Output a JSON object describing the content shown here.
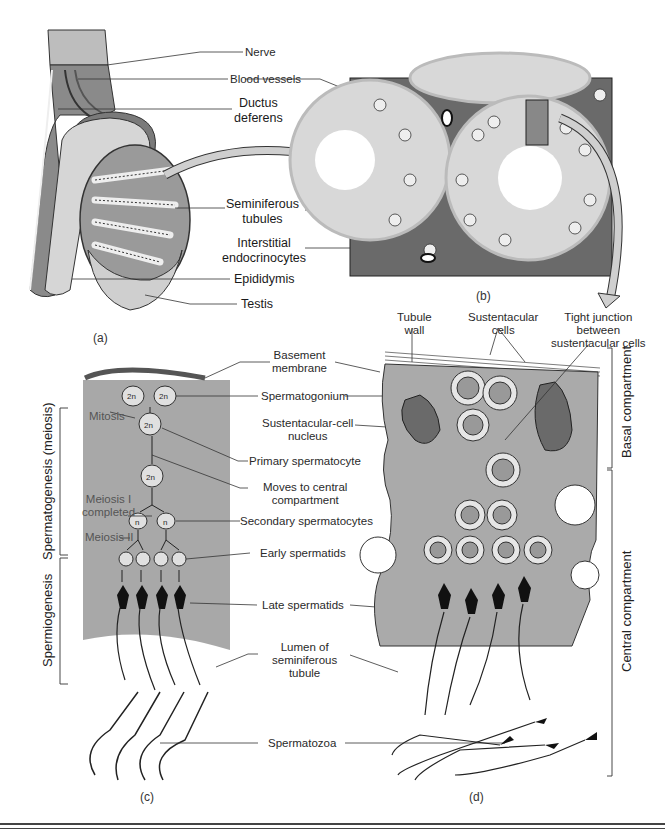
{
  "figure": {
    "panels": [
      {
        "id": "a",
        "caption": "(a)",
        "labels": {
          "nerve": "Nerve",
          "blood_vessels": "Blood vessels",
          "ductus_deferens": "Ductus\ndeferens",
          "seminiferous_tubules": "Seminiferous\ntubules",
          "interstitial_endocrinocytes": "Interstitial\nendocrinocytes",
          "epididymis": "Epididymis",
          "testis": "Testis"
        }
      },
      {
        "id": "b",
        "caption": "(b)"
      },
      {
        "id": "c",
        "caption": "(c)",
        "labels": {
          "mitosis": "Mitosis",
          "meiosis_i_completed": "Meiosis I\ncompleted",
          "meiosis_ii": "Meiosis II",
          "ploidy_2n": "2n",
          "ploidy_n": "n"
        },
        "phases": {
          "spermatogenesis": "Spermatogenesis (meiosis)",
          "spermiogenesis": "Spermiogenesis"
        }
      },
      {
        "id": "d",
        "caption": "(d)",
        "labels": {
          "tubule_wall": "Tubule\nwall",
          "sustentacular_cells": "Sustentacular\ncells",
          "tight_junction": "Tight junction\nbetween\nsustentacular cells"
        },
        "compartments": {
          "basal": "Basal compartment",
          "central": "Central compartment"
        }
      }
    ],
    "shared_labels": {
      "basement_membrane": "Basement\nmembrane",
      "spermatogonium": "Spermatogonium",
      "sustentacular_cell_nucleus": "Sustentacular-cell\nnucleus",
      "primary_spermatocyte": "Primary spermatocyte",
      "moves_to_central": "Moves to central\ncompartment",
      "secondary_spermatocytes": "Secondary spermatocytes",
      "early_spermatids": "Early spermatids",
      "late_spermatids": "Late spermatids",
      "lumen": "Lumen of\nseminiferous\ntubule",
      "spermatozoa": "Spermatozoa"
    },
    "colors": {
      "tissue_gray": "#a8a8a8",
      "dark_gray": "#6e6e6e",
      "light_gray": "#d0d0d0",
      "arrow_fill": "#c8c8c8",
      "line": "#333333"
    }
  }
}
